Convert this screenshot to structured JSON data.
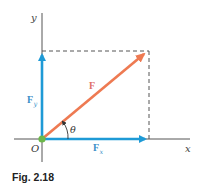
{
  "figure": {
    "caption": "Fig. 2.18",
    "labels": {
      "x_axis": "x",
      "y_axis": "y",
      "origin": "O",
      "force": "F",
      "force_x": "F",
      "force_x_sub": "x",
      "force_y": "F",
      "force_y_sub": "y",
      "angle": "θ"
    },
    "colors": {
      "axis": "#555555",
      "component_vector": "#1e9ad6",
      "resultant_vector": "#ee7a52",
      "dashed_guide": "#555555",
      "origin_dot": "#6cb84a",
      "label_blue": "#3a8fc8",
      "label_red": "#e0706a",
      "text": "#333333"
    }
  }
}
